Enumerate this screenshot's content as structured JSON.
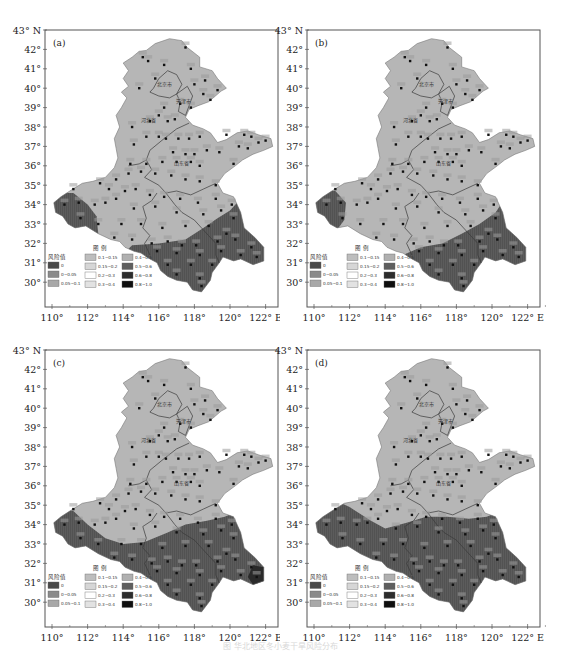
{
  "figure": {
    "caption": "图 华北地区冬小麦干旱风险分布",
    "axes": {
      "lat_ticks": [
        "43° N",
        "42°",
        "41°",
        "40°",
        "39°",
        "38°",
        "37°",
        "36°",
        "35°",
        "34°",
        "33°",
        "32°",
        "31°",
        "30°"
      ],
      "lon_ticks": [
        "110°",
        "112°",
        "114°",
        "116°",
        "118°",
        "120°",
        "122° E"
      ]
    },
    "legend": {
      "title": "图 例",
      "header": "风险值",
      "items": [
        {
          "label": "0",
          "color": "#4a4a4a"
        },
        {
          "label": "0~0.05",
          "color": "#8a8a8a"
        },
        {
          "label": "0.05~0.1",
          "color": "#a8a8a8"
        },
        {
          "label": "0.1~0.15",
          "color": "#bdbdbd"
        },
        {
          "label": "0.15~0.2",
          "color": "#d6d6d6"
        },
        {
          "label": "0.2~0.3",
          "color": "#ffffff"
        },
        {
          "label": "0.3~0.4",
          "color": "#e2e2e2"
        },
        {
          "label": "0.4~0.5",
          "color": "#b0b0b0"
        },
        {
          "label": "0.5~0.6",
          "color": "#5e5e5e"
        },
        {
          "label": "0.6~0.8",
          "color": "#2c2c2c"
        },
        {
          "label": "0.8~1.0",
          "color": "#0e0e0e"
        }
      ]
    },
    "region_labels": {
      "beijing": "北京市",
      "tianjin": "天津市",
      "hebei": "河北省",
      "shandong": "山东省"
    },
    "colors": {
      "low_risk": "#b6b6b6",
      "high_risk": "#5c5c5c",
      "very_high": "#2a2a2a",
      "border": "#3a3a3a",
      "frame": "#555555",
      "station": "#111111"
    },
    "panels": [
      {
        "tag": "(a)",
        "high_zone": "south-east band + western tip"
      },
      {
        "tag": "(b)",
        "high_zone": "south-east band + small western lobe"
      },
      {
        "tag": "(c)",
        "high_zone": "southern half + western tip"
      },
      {
        "tag": "(d)",
        "high_zone": "entire southern half"
      }
    ]
  },
  "chart_data": {
    "type": "heatmap",
    "xlabel": "Longitude",
    "ylabel": "Latitude",
    "xlim": [
      110,
      122.5
    ],
    "ylim": [
      29.5,
      43
    ],
    "x_ticks": [
      110,
      112,
      114,
      116,
      118,
      120,
      122
    ],
    "y_ticks": [
      30,
      31,
      32,
      33,
      34,
      35,
      36,
      37,
      38,
      39,
      40,
      41,
      42,
      43
    ],
    "legend_classes": [
      "0",
      "0~0.05",
      "0.05~0.1",
      "0.1~0.15",
      "0.15~0.2",
      "0.2~0.3",
      "0.3~0.4",
      "0.4~0.5",
      "0.5~0.6",
      "0.6~0.8",
      "0.8~1.0"
    ],
    "panels": [
      {
        "tag": "(a)",
        "north_class": "0.1~0.15",
        "south_class": "0.5~0.6",
        "boundary": "approx 33.8°N west tip (110–113°E); band south of ~32°N (114–117°E) rising to ~34°N at 120°E"
      },
      {
        "tag": "(b)",
        "north_class": "0.1~0.15",
        "south_class": "0.5~0.6",
        "boundary": "small western lobe 110–111.8°E, 33–34.5°N; band south of ~31.8°N rising to ~34°N at 120°E"
      },
      {
        "tag": "(c)",
        "north_class": "0.1~0.15",
        "south_class": "0.5~0.6",
        "boundary": "boundary ~34.5°N at 111°E, dips to ~33°N at 114°E, rises to ~34.3°N at 120°E; darkest (0.6~0.8) near 121.5°E,31.3°N"
      },
      {
        "tag": "(d)",
        "north_class": "0.1~0.15",
        "south_class": "0.5~0.6",
        "boundary": "boundary ~35°N west, ~33.8°N at 114°E, ~34.3°N at 120°E"
      }
    ]
  }
}
